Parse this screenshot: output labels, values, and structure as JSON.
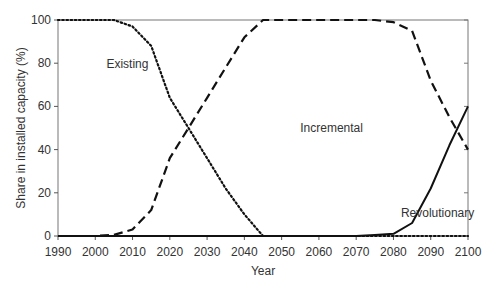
{
  "chart_data": {
    "type": "line",
    "title": "",
    "xlabel": "Year",
    "ylabel": "Share in installed capacity (%)",
    "xlim": [
      1990,
      2100
    ],
    "ylim": [
      0,
      100
    ],
    "xticks": [
      1990,
      2000,
      2010,
      2020,
      2030,
      2040,
      2050,
      2060,
      2070,
      2080,
      2090,
      2100
    ],
    "yticks": [
      0,
      20,
      40,
      60,
      80,
      100
    ],
    "grid": false,
    "legend": "inline labels",
    "series": [
      {
        "name": "Existing",
        "style": "dotted",
        "x": [
          1990,
          2000,
          2005,
          2010,
          2015,
          2020,
          2025,
          2030,
          2035,
          2040,
          2045,
          2050,
          2060,
          2070,
          2080,
          2090,
          2100
        ],
        "values": [
          100,
          100,
          100,
          97,
          88,
          64,
          50,
          36,
          22,
          10,
          0,
          0,
          0,
          0,
          0,
          0,
          0
        ]
      },
      {
        "name": "Incremental",
        "style": "dashed",
        "x": [
          1990,
          2000,
          2005,
          2010,
          2015,
          2020,
          2025,
          2030,
          2035,
          2040,
          2045,
          2050,
          2060,
          2070,
          2075,
          2080,
          2085,
          2090,
          2095,
          2100
        ],
        "values": [
          0,
          0,
          0.5,
          3,
          12,
          36,
          50,
          64,
          78,
          92,
          100,
          100,
          100,
          100,
          100,
          99,
          95,
          72,
          55,
          40
        ]
      },
      {
        "name": "Revolutionary",
        "style": "solid",
        "x": [
          1990,
          2000,
          2010,
          2020,
          2030,
          2040,
          2050,
          2060,
          2070,
          2075,
          2080,
          2085,
          2090,
          2095,
          2100
        ],
        "values": [
          0,
          0,
          0,
          0,
          0,
          0,
          0,
          0,
          0,
          0.5,
          1,
          6,
          22,
          42,
          60
        ]
      }
    ],
    "annotations": [
      {
        "text": "Existing",
        "x": 2003,
        "y": 78
      },
      {
        "text": "Incremental",
        "x": 2055,
        "y": 48
      },
      {
        "text": "Revolutionary",
        "x": 2082,
        "y": 9
      }
    ]
  }
}
